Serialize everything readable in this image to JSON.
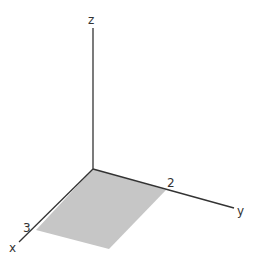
{
  "diagram": {
    "type": "3d-coordinate-axes",
    "axes": {
      "x": {
        "label": "x",
        "tick": "3"
      },
      "y": {
        "label": "y",
        "tick": "2"
      },
      "z": {
        "label": "z"
      }
    },
    "region": {
      "description": "rectangle in xy-plane from 0 to 3 in x and 0 to 2 in y",
      "fill": "#c6c6c6"
    },
    "colors": {
      "axis": "#333333",
      "background": "#ffffff"
    }
  }
}
